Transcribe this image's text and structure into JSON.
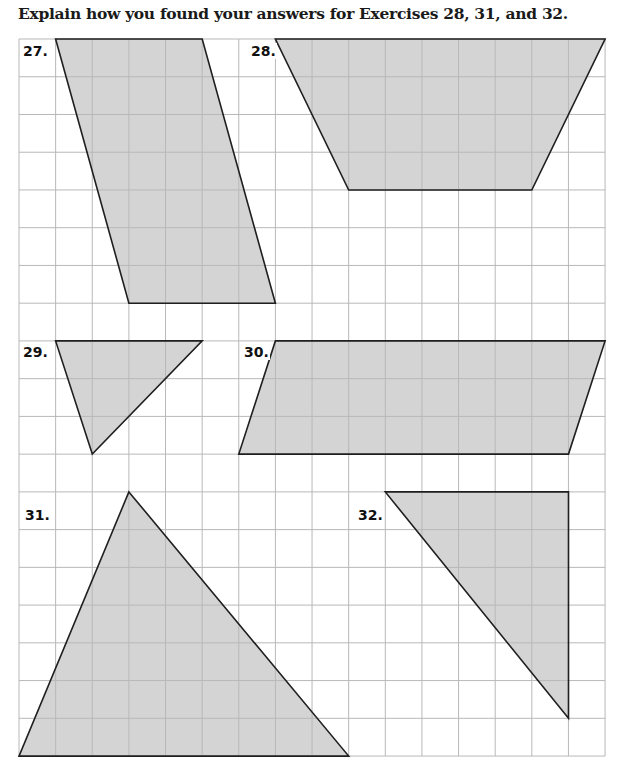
{
  "instruction": "Explain how you found your answers for Exercises 28, 31, and 32.",
  "grid": {
    "origin_x": 19,
    "origin_y": 39,
    "cols": 16,
    "rows": 19,
    "cell_w": 36.63,
    "cell_h": 37.74,
    "line_color": "#b8b8b8",
    "fill_color": "#d4d4d4",
    "stroke_color": "#1f1f1f"
  },
  "exercises": [
    {
      "number": "27.",
      "shape": "parallelogram",
      "points_grid": [
        [
          1,
          0
        ],
        [
          5,
          0
        ],
        [
          7,
          7
        ],
        [
          3,
          7
        ]
      ]
    },
    {
      "number": "28.",
      "shape": "trapezoid",
      "points_grid": [
        [
          7,
          0
        ],
        [
          16,
          0
        ],
        [
          14,
          4
        ],
        [
          9,
          4
        ]
      ]
    },
    {
      "number": "29.",
      "shape": "triangle",
      "points_grid": [
        [
          1,
          8
        ],
        [
          5,
          8
        ],
        [
          2,
          11
        ]
      ]
    },
    {
      "number": "30.",
      "shape": "parallelogram",
      "points_grid": [
        [
          7,
          8
        ],
        [
          16,
          8
        ],
        [
          15,
          11
        ],
        [
          6,
          11
        ]
      ]
    },
    {
      "number": "31.",
      "shape": "triangle",
      "points_grid": [
        [
          3,
          12
        ],
        [
          9,
          19
        ],
        [
          0,
          19
        ]
      ]
    },
    {
      "number": "32.",
      "shape": "right-triangle",
      "points_grid": [
        [
          10,
          12
        ],
        [
          15,
          12
        ],
        [
          15,
          18
        ]
      ]
    }
  ]
}
